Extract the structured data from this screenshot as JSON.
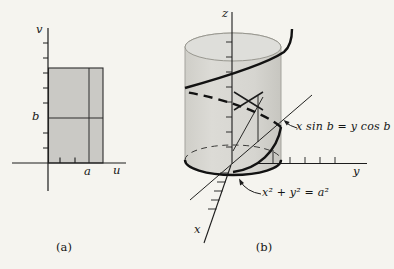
{
  "figure_a": {
    "caption": "(a)",
    "v_axis_label": "v",
    "u_axis_label": "u",
    "a_tick_label": "a",
    "b_tick_label": "b"
  },
  "figure_b": {
    "caption": "(b)",
    "z_axis_label": "z",
    "y_axis_label": "y",
    "x_axis_label": "x",
    "plane_equation_label": "x sin b = y cos b",
    "cylinder_equation_label": "x² + y² = a²"
  },
  "colors": {
    "paper": "#f5f4ef",
    "shaded_rectangle": "#cac9c5",
    "cylinder_body": "#d8d7d2",
    "cylinder_top": "#dededa",
    "line_ink": "#1c1c1c"
  }
}
